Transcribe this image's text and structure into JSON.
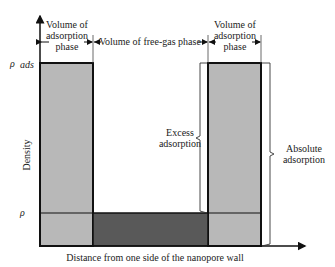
{
  "diagram": {
    "title": "",
    "y_axis_label": "Density",
    "x_axis_label": "Distance from one side of the nanopore wall",
    "y_ticks": {
      "rho_ads": "ρ",
      "rho_ads_sub": "ads",
      "rho": "ρ"
    },
    "top_labels": {
      "left_adsorption": [
        "Volume of",
        "adsorption",
        "phase"
      ],
      "free_gas": "Volume of free-gas phase",
      "right_adsorption": [
        "Volume of",
        "adsorption",
        "phase"
      ]
    },
    "brackets": {
      "excess": [
        "Excess",
        "adsorption"
      ],
      "absolute": [
        "Absolute",
        "adsorption"
      ]
    },
    "colors": {
      "adsorption_fill": "#b8b8b8",
      "free_gas_fill": "#595959",
      "outline": "#111111"
    }
  }
}
